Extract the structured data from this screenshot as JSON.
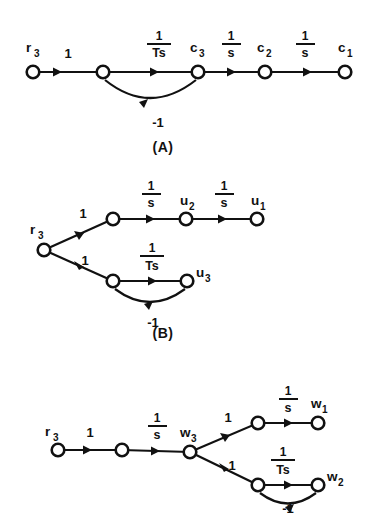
{
  "figure": {
    "background_color": "#ffffff",
    "line_color": "#111111",
    "node_fill": "#ffffff"
  },
  "graphs": [
    {
      "id": "A",
      "caption": "(A)",
      "nodes": [
        {
          "name": "r3",
          "label_base": "r",
          "label_sub": "3"
        },
        {
          "name": "n1",
          "label_base": "",
          "label_sub": ""
        },
        {
          "name": "c3",
          "label_base": "c",
          "label_sub": "3"
        },
        {
          "name": "c2",
          "label_base": "c",
          "label_sub": "2"
        },
        {
          "name": "c1",
          "label_base": "c",
          "label_sub": "1"
        }
      ],
      "edges": [
        {
          "from": "r3",
          "to": "n1",
          "gain": "1",
          "type": "straight"
        },
        {
          "from": "n1",
          "to": "c3",
          "gain_num": "1",
          "gain_den": "Ts",
          "type": "straight-fraction"
        },
        {
          "from": "c3",
          "to": "c2",
          "gain_num": "1",
          "gain_den": "s",
          "type": "straight-fraction"
        },
        {
          "from": "c2",
          "to": "c1",
          "gain_num": "1",
          "gain_den": "s",
          "type": "straight-fraction"
        },
        {
          "from": "c3",
          "to": "n1",
          "gain": "-1",
          "type": "feedback-arc"
        }
      ]
    },
    {
      "id": "B",
      "caption": "(B)",
      "nodes": [
        {
          "name": "r3",
          "label_base": "r",
          "label_sub": "3"
        },
        {
          "name": "nb1",
          "label_base": "",
          "label_sub": ""
        },
        {
          "name": "u2",
          "label_base": "u",
          "label_sub": "2"
        },
        {
          "name": "u1",
          "label_base": "u",
          "label_sub": "1"
        },
        {
          "name": "nb2",
          "label_base": "",
          "label_sub": ""
        },
        {
          "name": "u3",
          "label_base": "u",
          "label_sub": "3"
        }
      ],
      "edges": [
        {
          "from": "r3",
          "to": "nb1",
          "gain": "1",
          "type": "diagonal-up"
        },
        {
          "from": "nb1",
          "to": "u2",
          "gain_num": "1",
          "gain_den": "s",
          "type": "straight-fraction"
        },
        {
          "from": "u2",
          "to": "u1",
          "gain_num": "1",
          "gain_den": "s",
          "type": "straight-fraction"
        },
        {
          "from": "r3",
          "to": "nb2",
          "gain": "1",
          "type": "diagonal-down"
        },
        {
          "from": "nb2",
          "to": "u3",
          "gain_num": "1",
          "gain_den": "Ts",
          "type": "straight-fraction"
        },
        {
          "from": "u3",
          "to": "nb2",
          "gain": "-1",
          "type": "feedback-arc"
        }
      ]
    },
    {
      "id": "C",
      "caption": "",
      "nodes": [
        {
          "name": "r3",
          "label_base": "r",
          "label_sub": "3"
        },
        {
          "name": "nc1",
          "label_base": "",
          "label_sub": ""
        },
        {
          "name": "w3",
          "label_base": "w",
          "label_sub": "3"
        },
        {
          "name": "nc2",
          "label_base": "",
          "label_sub": ""
        },
        {
          "name": "w1",
          "label_base": "w",
          "label_sub": "1"
        },
        {
          "name": "nc3",
          "label_base": "",
          "label_sub": ""
        },
        {
          "name": "w2",
          "label_base": "w",
          "label_sub": "2"
        }
      ],
      "edges": [
        {
          "from": "r3",
          "to": "nc1",
          "gain": "1",
          "type": "straight"
        },
        {
          "from": "nc1",
          "to": "w3",
          "gain_num": "1",
          "gain_den": "s",
          "type": "straight-fraction"
        },
        {
          "from": "w3",
          "to": "nc2",
          "gain": "1",
          "type": "diagonal-up"
        },
        {
          "from": "nc2",
          "to": "w1",
          "gain_num": "1",
          "gain_den": "s",
          "type": "straight-fraction"
        },
        {
          "from": "w3",
          "to": "nc3",
          "gain": "1",
          "type": "diagonal-down"
        },
        {
          "from": "nc3",
          "to": "w2",
          "gain_num": "1",
          "gain_den": "Ts",
          "type": "straight-fraction"
        },
        {
          "from": "w2",
          "to": "nc3",
          "gain": "-1",
          "type": "feedback-arc"
        }
      ]
    }
  ],
  "labels": {
    "a_r3_base": "r",
    "a_r3_sub": "3",
    "a_gain1": "1",
    "a_frac1_num": "1",
    "a_frac1_den": "Ts",
    "a_c3_base": "c",
    "a_c3_sub": "3",
    "a_frac2_num": "1",
    "a_frac2_den": "s",
    "a_c2_base": "c",
    "a_c2_sub": "2",
    "a_frac3_num": "1",
    "a_frac3_den": "s",
    "a_c1_base": "c",
    "a_c1_sub": "1",
    "a_fb": "-1",
    "caption_a": "(A)",
    "b_r3_base": "r",
    "b_r3_sub": "3",
    "b_gain_up": "1",
    "b_frac1_num": "1",
    "b_frac1_den": "s",
    "b_u2_base": "u",
    "b_u2_sub": "2",
    "b_frac2_num": "1",
    "b_frac2_den": "s",
    "b_u1_base": "u",
    "b_u1_sub": "1",
    "b_gain_dn": "1",
    "b_frac3_num": "1",
    "b_frac3_den": "Ts",
    "b_u3_base": "u",
    "b_u3_sub": "3",
    "b_fb": "-1",
    "caption_b": "(B)",
    "c_r3_base": "r",
    "c_r3_sub": "3",
    "c_gain1": "1",
    "c_frac1_num": "1",
    "c_frac1_den": "s",
    "c_w3_base": "w",
    "c_w3_sub": "3",
    "c_gain_up": "1",
    "c_frac2_num": "1",
    "c_frac2_den": "s",
    "c_w1_base": "w",
    "c_w1_sub": "1",
    "c_gain_dn": "1",
    "c_frac3_num": "1",
    "c_frac3_den": "Ts",
    "c_w2_base": "w",
    "c_w2_sub": "2",
    "c_fb": "-1"
  }
}
